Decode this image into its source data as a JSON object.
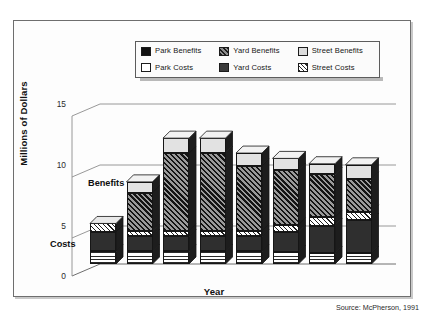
{
  "figure": {
    "source_note": "Source: McPherson, 1991"
  },
  "legend": {
    "items": [
      {
        "label": "Park Benefits",
        "swatch": "solid-black",
        "key": "park_benefits"
      },
      {
        "label": "Yard Benefits",
        "swatch": "diagonal-hatch-dark",
        "key": "yard_benefits"
      },
      {
        "label": "Street Benefits",
        "swatch": "solid-light-gray",
        "key": "street_benefits"
      },
      {
        "label": "Park Costs",
        "swatch": "solid-white",
        "key": "park_costs"
      },
      {
        "label": "Yard Costs",
        "swatch": "solid-dark-gray",
        "key": "yard_costs"
      },
      {
        "label": "Street Costs",
        "swatch": "diagonal-hatch-light",
        "key": "street_costs"
      }
    ]
  },
  "annotations": {
    "benefits": "Benefits",
    "costs": "Costs"
  },
  "chart_data": {
    "type": "bar",
    "title": "",
    "subtitle": "",
    "xlabel": "Year",
    "ylabel": "Millions of Dollars",
    "categories": [
      "1993",
      "1998",
      "2003",
      "2008",
      "2013",
      "2018",
      "2023",
      "2028"
    ],
    "yticks": [
      0,
      5,
      10,
      15
    ],
    "ylim": [
      0,
      16
    ],
    "grid": true,
    "stacked": true,
    "three_d": true,
    "legend_position": "top-center",
    "annotations": [
      {
        "text": "Benefits",
        "x": "1993",
        "y": 7.5
      },
      {
        "text": "Costs",
        "x": "1993",
        "y": 2.6
      }
    ],
    "series": [
      {
        "name": "Park Costs",
        "group": "costs",
        "values": [
          1.2,
          1.2,
          1.2,
          1.2,
          1.2,
          1.1,
          1.0,
          1.0
        ]
      },
      {
        "name": "Yard Costs",
        "group": "costs",
        "values": [
          1.8,
          1.4,
          1.4,
          1.4,
          1.4,
          1.9,
          2.6,
          3.1
        ]
      },
      {
        "name": "Street Costs",
        "group": "costs",
        "values": [
          0.8,
          0.5,
          0.5,
          0.5,
          0.5,
          0.7,
          0.8,
          0.8
        ]
      },
      {
        "name": "Park Benefits",
        "group": "benefits",
        "values": [
          0.0,
          0.0,
          0.0,
          0.0,
          0.0,
          0.0,
          0.0,
          0.0
        ]
      },
      {
        "name": "Yard Benefits",
        "group": "benefits",
        "values": [
          0.0,
          3.6,
          7.3,
          7.3,
          6.1,
          5.1,
          4.0,
          3.1
        ]
      },
      {
        "name": "Street Benefits",
        "group": "benefits",
        "values": [
          0.0,
          1.0,
          1.4,
          1.4,
          1.2,
          1.1,
          1.0,
          1.3
        ]
      }
    ],
    "totals": [
      3.8,
      7.7,
      11.8,
      11.8,
      10.4,
      9.9,
      9.4,
      9.3
    ],
    "source": "Source: McPherson, 1991"
  }
}
